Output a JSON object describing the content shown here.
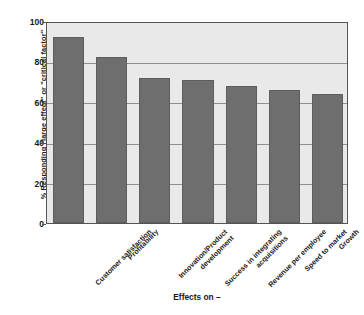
{
  "chart_data": {
    "type": "bar",
    "title": "",
    "xlabel": "Effects on –",
    "ylabel": "% Responding \"large effect\" or \"critical factor\"",
    "categories": [
      "Customer satisfaction",
      "Profitability",
      "Innovation/Product\ndevelopment",
      "Success in integrating\nacquisitions",
      "Revenue per employee",
      "Speed to market",
      "Growth"
    ],
    "values": [
      92,
      82,
      72,
      71,
      68,
      66,
      64
    ],
    "ylim": [
      0,
      100
    ],
    "yticks": [
      0,
      20,
      40,
      60,
      80,
      100
    ],
    "ytick_labels": [
      "0",
      "20",
      "40",
      "60",
      "80",
      "100"
    ],
    "grid": true,
    "legend": "none",
    "bar_color": "#6e6e6e",
    "plot_background": "#e9e9e9",
    "grid_color": "#8f8f8f",
    "frame_color": "#555555"
  }
}
